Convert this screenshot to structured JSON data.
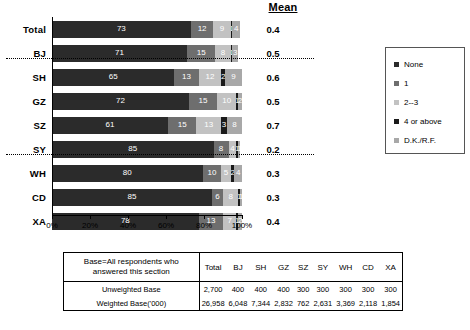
{
  "header": {
    "mean_label": "Mean"
  },
  "chart_data": {
    "type": "bar",
    "subtype": "stacked-horizontal-100pct",
    "title": "",
    "xlabel": "",
    "ylabel": "",
    "xlim": [
      0,
      100
    ],
    "xticks": [
      "0%",
      "20%",
      "40%",
      "60%",
      "80%",
      "100%"
    ],
    "grid": false,
    "legend_position": "right",
    "series": [
      {
        "name": "None",
        "color": "#2b2b2b",
        "values": [
          73,
          71,
          65,
          72,
          61,
          85,
          80,
          85,
          78
        ]
      },
      {
        "name": "1",
        "color": "#6e6e6e",
        "values": [
          12,
          15,
          13,
          15,
          15,
          8,
          10,
          6,
          13
        ]
      },
      {
        "name": "2--3",
        "color": "#c2c2c2",
        "values": [
          9,
          8,
          12,
          10,
          13,
          4,
          5,
          8,
          7
        ]
      },
      {
        "name": "4 or above",
        "color": "#1a1a1a",
        "values": [
          1,
          1,
          2,
          1,
          3,
          1,
          2,
          1,
          1
        ]
      },
      {
        "name": "D.K./R.F.",
        "color": "#a8a8a8",
        "values": [
          4,
          3,
          9,
          2,
          8,
          1,
          4,
          1,
          2
        ]
      }
    ],
    "categories": [
      "Total",
      "BJ",
      "SH",
      "GZ",
      "SZ",
      "SY",
      "WH",
      "CD",
      "XA"
    ],
    "mean_column_label": "Mean",
    "means": [
      "0.4",
      "0.5",
      "0.6",
      "0.5",
      "0.7",
      "0.2",
      "0.3",
      "0.3",
      "0.4"
    ],
    "segment_labels": [
      [
        "73",
        "12",
        "9",
        "1",
        "4"
      ],
      [
        "71",
        "15",
        "8",
        "1",
        "3"
      ],
      [
        "65",
        "13",
        "12",
        "2",
        "9"
      ],
      [
        "72",
        "15",
        "10",
        "1",
        "2"
      ],
      [
        "61",
        "15",
        "13",
        "3",
        "8"
      ],
      [
        "85",
        "8",
        "4",
        "1",
        "1"
      ],
      [
        "80",
        "10",
        "5",
        "2",
        "4"
      ],
      [
        "85",
        "6",
        "8",
        "1",
        "1"
      ],
      [
        "78",
        "13",
        "7",
        "1",
        "2"
      ]
    ],
    "dividers_after": [
      "Total",
      "SZ"
    ]
  },
  "legend": {
    "items": [
      {
        "label": "None",
        "color": "#2b2b2b"
      },
      {
        "label": "1",
        "color": "#6e6e6e"
      },
      {
        "label": "2--3",
        "color": "#c2c2c2"
      },
      {
        "label": "4 or above",
        "color": "#1a1a1a"
      },
      {
        "label": "D.K./R.F.",
        "color": "#a8a8a8"
      }
    ]
  },
  "base_table": {
    "corner_label": "Base=All respondents who answered this section",
    "columns": [
      "Total",
      "BJ",
      "SH",
      "GZ",
      "SZ",
      "SY",
      "WH",
      "CD",
      "XA"
    ],
    "rows": [
      {
        "label": "Unweighted Base",
        "values": [
          "2,700",
          "400",
          "400",
          "400",
          "300",
          "300",
          "300",
          "300",
          "300"
        ]
      },
      {
        "label": "Weighted Base('000)",
        "values": [
          "26,958",
          "6,048",
          "7,344",
          "2,832",
          "762",
          "2,631",
          "3,369",
          "2,118",
          "1,854"
        ]
      }
    ]
  }
}
